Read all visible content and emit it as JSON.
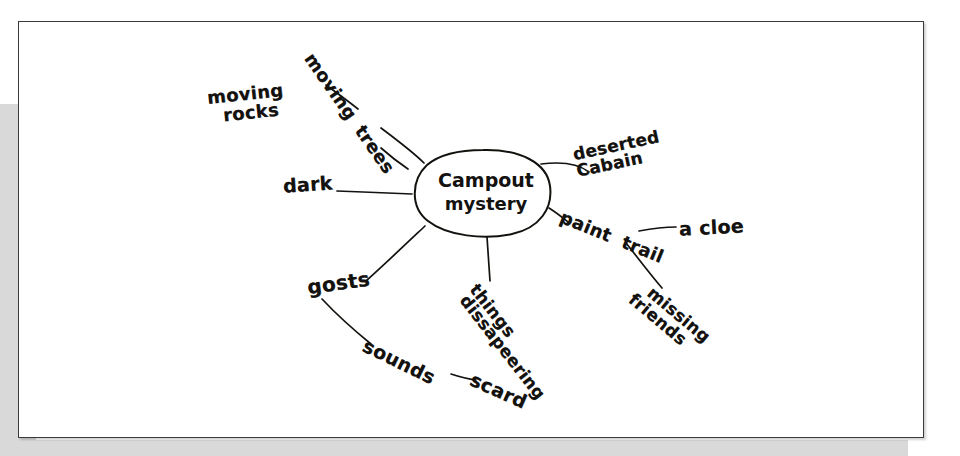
{
  "document": {
    "kind": "handwritten-concept-web",
    "medium": "pencil on white paper, scanned",
    "ink_color": "#14120f",
    "paper_color": "#ffffff",
    "backdrop_color": "#d9d9d9",
    "border_color": "#3a3a3a"
  },
  "diagram": {
    "type": "concept-web",
    "center": {
      "label_line1": "Campout",
      "label_line2": "mystery",
      "shape": "ellipse"
    },
    "nodes": [
      {
        "id": "moving-rocks",
        "label": "moving rocks",
        "line1": "moving",
        "line2": "rocks",
        "connected_to_center": false,
        "rotation": -6
      },
      {
        "id": "moving-trees",
        "label": "moving trees",
        "line1": "moving",
        "line2": "trees",
        "connected_to_center": true,
        "rotation": 55
      },
      {
        "id": "dark",
        "label": "dark",
        "line1": "dark",
        "line2": "",
        "connected_to_center": true,
        "rotation": -4
      },
      {
        "id": "deserted-cabain",
        "label": "deserted Cabain",
        "line1": "deserted",
        "line2": "Cabain",
        "connected_to_center": true,
        "rotation": -12
      },
      {
        "id": "paint-trail",
        "label": "paint trail",
        "line1": "paint",
        "line2": "trail",
        "connected_to_center": true,
        "rotation": 22
      },
      {
        "id": "a-cloe",
        "label": "a cloe",
        "line1": "a cloe",
        "line2": "",
        "connected_to_center": false,
        "rotation": -3
      },
      {
        "id": "missing-friends",
        "label": "missing friends",
        "line1": "missing",
        "line2": "friends",
        "connected_to_center": false,
        "rotation": 40
      },
      {
        "id": "things-dissapeering",
        "label": "things dissapeering",
        "line1": "things",
        "line2": "dissapeering",
        "connected_to_center": true,
        "rotation": 52
      },
      {
        "id": "gosts",
        "label": "gosts",
        "line1": "gosts",
        "line2": "",
        "connected_to_center": true,
        "rotation": -8
      },
      {
        "id": "sounds",
        "label": "sounds",
        "line1": "sounds",
        "line2": "",
        "connected_to_center": false,
        "rotation": 26
      },
      {
        "id": "scard",
        "label": "scard",
        "line1": "scard",
        "line2": "",
        "connected_to_center": false,
        "rotation": 24
      }
    ],
    "edges": [
      {
        "from": "center",
        "to": "moving-trees"
      },
      {
        "from": "center",
        "to": "dark"
      },
      {
        "from": "center",
        "to": "deserted-cabain"
      },
      {
        "from": "center",
        "to": "paint-trail"
      },
      {
        "from": "center",
        "to": "things-dissapeering"
      },
      {
        "from": "center",
        "to": "gosts"
      },
      {
        "from": "paint-trail",
        "to": "a-cloe"
      },
      {
        "from": "paint-trail",
        "to": "missing-friends"
      },
      {
        "from": "gosts",
        "to": "sounds"
      },
      {
        "from": "sounds",
        "to": "scard"
      }
    ]
  }
}
